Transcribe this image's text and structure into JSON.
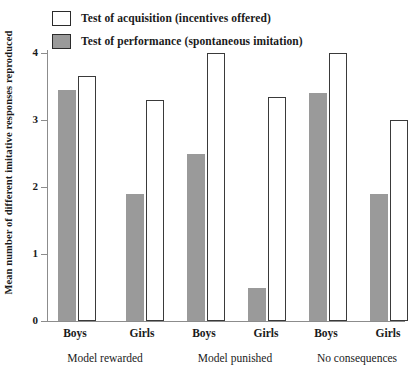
{
  "chart_data": {
    "type": "bar",
    "title": "",
    "subtitle": "",
    "xlabel": "",
    "ylabel": "Mean number of different imitative responses reproduced",
    "ylim": [
      0,
      4.25
    ],
    "yticks": [
      0,
      1,
      2,
      3,
      4
    ],
    "ytick_labels": [
      "0",
      "1",
      "2",
      "3",
      "4"
    ],
    "grid": false,
    "legend_position": "top-left",
    "categories": [
      "Boys",
      "Girls",
      "Boys",
      "Girls",
      "Boys",
      "Girls"
    ],
    "groups": [
      {
        "name": "Model rewarded",
        "categories": [
          "Boys",
          "Girls"
        ]
      },
      {
        "name": "Model punished",
        "categories": [
          "Boys",
          "Girls"
        ]
      },
      {
        "name": "No consequences",
        "categories": [
          "Boys",
          "Girls"
        ]
      }
    ],
    "series": [
      {
        "name": "Test of performance (spontaneous imitation)",
        "swatch": "filled",
        "color": "#9a9a9a",
        "values": [
          3.45,
          1.9,
          2.5,
          0.5,
          3.4,
          1.9
        ]
      },
      {
        "name": "Test of acquisition (incentives offered)",
        "swatch": "open",
        "color": "#ffffff",
        "values": [
          3.65,
          3.3,
          4.0,
          3.35,
          4.0,
          3.0
        ]
      }
    ]
  },
  "legend": {
    "items": [
      {
        "label": "Test of acquisition (incentives offered)",
        "style": "open"
      },
      {
        "label": "Test of performance (spontaneous imitation)",
        "style": "filled"
      }
    ]
  },
  "axes": {
    "y_title": "Mean number of different imitative responses reproduced",
    "y_ticks": [
      "4",
      "3",
      "2",
      "1",
      "0"
    ],
    "x_ticks": [
      "Boys",
      "Girls",
      "Boys",
      "Girls",
      "Boys",
      "Girls"
    ],
    "x_groups": [
      "Model rewarded",
      "Model punished",
      "No consequences"
    ]
  },
  "colors": {
    "bar_filled": "#9a9a9a",
    "bar_open": "#ffffff",
    "bar_outline": "#3a3a3a",
    "axis": "#8c8c8c",
    "text": "#1a1a1a"
  }
}
